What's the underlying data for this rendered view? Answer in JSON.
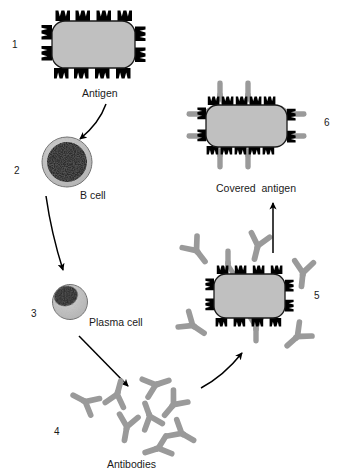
{
  "diagram": {
    "background_color": "#ffffff",
    "colors": {
      "antigen_body": "#c0c0c0",
      "antigen_outline": "#1a1a1a",
      "spike": "#000000",
      "antibody": "#9a9a9a",
      "cell_cytoplasm": "#c3c3c3",
      "nucleus": "#2b2b2b",
      "arrow": "#000000",
      "text": "#1a1a1a"
    }
  },
  "steps": [
    {
      "number": "1",
      "caption": "Antigen",
      "element": "antigen-spiked",
      "num_pos": {
        "x": 12,
        "y": 40
      },
      "cap_pos": {
        "x": 82,
        "y": 88
      }
    },
    {
      "number": "2",
      "caption": "B cell",
      "element": "b-cell",
      "num_pos": {
        "x": 14,
        "y": 166
      },
      "cap_pos": {
        "x": 80,
        "y": 190
      }
    },
    {
      "number": "3",
      "caption": "Plasma cell",
      "element": "plasma-cell",
      "num_pos": {
        "x": 31,
        "y": 309
      },
      "cap_pos": {
        "x": 89,
        "y": 317
      }
    },
    {
      "number": "4",
      "caption": "Antibodies",
      "element": "antibody-cluster",
      "num_pos": {
        "x": 54,
        "y": 427
      },
      "cap_pos": {
        "x": 107,
        "y": 459
      }
    },
    {
      "number": "5",
      "caption": "",
      "element": "antigen-with-binding-antibodies",
      "num_pos": {
        "x": 314,
        "y": 291
      },
      "cap_pos": {
        "x": 0,
        "y": 0
      }
    },
    {
      "number": "6",
      "caption": "Covered  antigen",
      "element": "covered-antigen",
      "num_pos": {
        "x": 324,
        "y": 118
      },
      "cap_pos": {
        "x": 216,
        "y": 183
      }
    }
  ],
  "arrows": [
    {
      "name": "antigen-to-bcell",
      "from": "1",
      "to": "2"
    },
    {
      "name": "bcell-to-plasmacell",
      "from": "2",
      "to": "3"
    },
    {
      "name": "plasmacell-to-antibodies",
      "from": "3",
      "to": "4"
    },
    {
      "name": "antibodies-to-binding",
      "from": "4",
      "to": "5"
    },
    {
      "name": "binding-to-covered",
      "from": "5",
      "to": "6"
    }
  ]
}
